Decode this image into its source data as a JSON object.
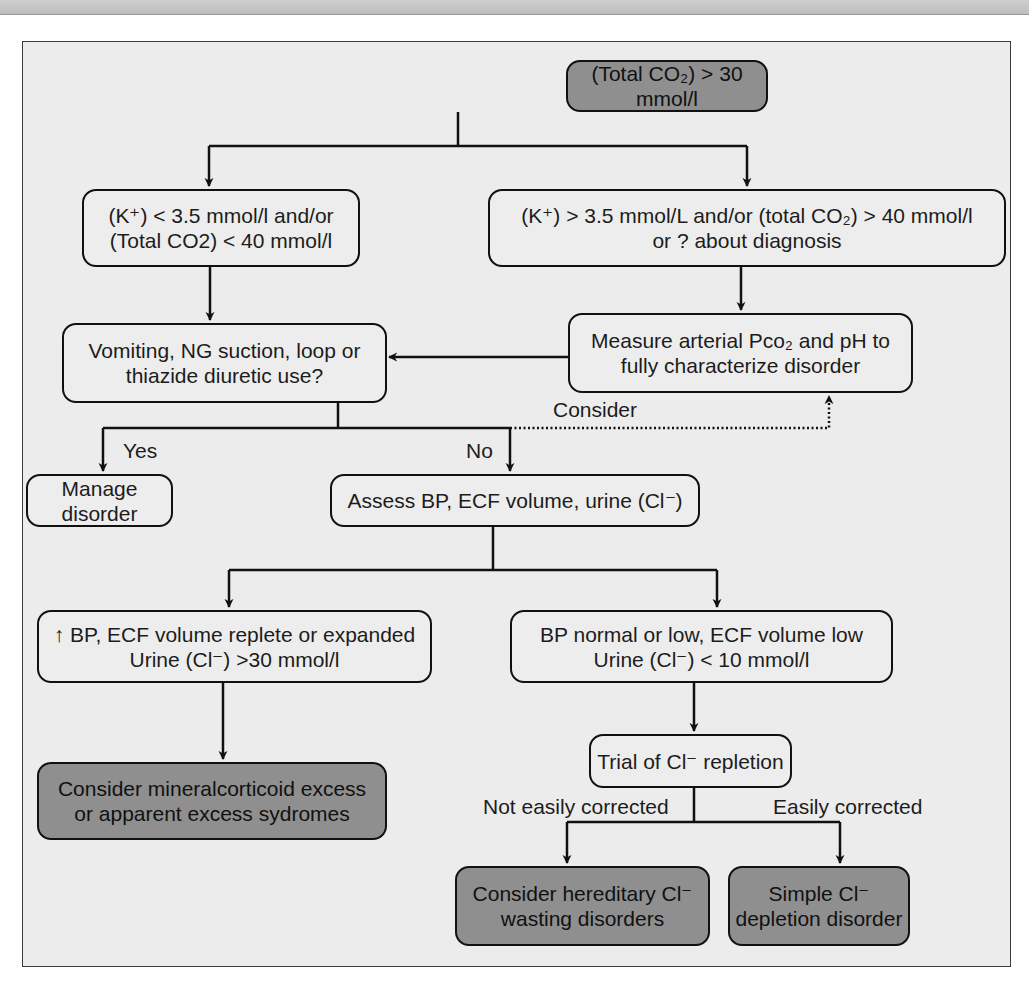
{
  "diagram": {
    "type": "flowchart",
    "colors": {
      "frame_background": "#ececec",
      "box_light": "#ededed",
      "box_dark": "#8f8f8f",
      "line": "#111111"
    },
    "nodes": {
      "start": {
        "lines": [
          "(Total CO₂) > 30 mmol/l"
        ],
        "style": "dark"
      },
      "low_k": {
        "lines": [
          "(K⁺) < 3.5 mmol/l and/or",
          "(Total CO2) < 40 mmol/l"
        ],
        "style": "light"
      },
      "high_k": {
        "lines": [
          "(K⁺) > 3.5 mmol/L and/or (total CO₂) > 40 mmol/l",
          "or ? about diagnosis"
        ],
        "style": "light"
      },
      "vomiting": {
        "lines": [
          "Vomiting, NG suction, loop or",
          "thiazide diuretic use?"
        ],
        "style": "light"
      },
      "measure": {
        "lines": [
          "Measure arterial Pco₂ and pH to",
          "fully characterize disorder"
        ],
        "style": "light"
      },
      "manage": {
        "lines": [
          "Manage disorder"
        ],
        "style": "light"
      },
      "assess": {
        "lines": [
          "Assess BP, ECF volume, urine (Cl⁻)"
        ],
        "style": "light"
      },
      "high_bp": {
        "lines": [
          "↑ BP, ECF volume replete or expanded",
          "Urine (Cl⁻) >30 mmol/l"
        ],
        "style": "light"
      },
      "low_bp": {
        "lines": [
          "BP normal or low, ECF volume low",
          "Urine (Cl⁻) < 10 mmol/l"
        ],
        "style": "light"
      },
      "mineralocorticoid": {
        "lines": [
          "Consider mineralcorticoid excess",
          "or apparent excess sydromes"
        ],
        "style": "dark"
      },
      "trial": {
        "lines": [
          "Trial of Cl⁻ repletion"
        ],
        "style": "light"
      },
      "hereditary": {
        "lines": [
          "Consider hereditary Cl⁻",
          "wasting disorders"
        ],
        "style": "dark"
      },
      "simple": {
        "lines": [
          "Simple Cl⁻",
          "depletion disorder"
        ],
        "style": "dark"
      }
    },
    "edge_labels": {
      "yes": "Yes",
      "no": "No",
      "consider": "Consider",
      "not_easily": "Not easily corrected",
      "easily": "Easily corrected"
    },
    "edges": [
      {
        "from": "start",
        "to": "low_k"
      },
      {
        "from": "start",
        "to": "high_k"
      },
      {
        "from": "low_k",
        "to": "vomiting"
      },
      {
        "from": "high_k",
        "to": "measure"
      },
      {
        "from": "measure",
        "to": "vomiting"
      },
      {
        "from": "vomiting",
        "to": "manage",
        "label": "Yes"
      },
      {
        "from": "vomiting",
        "to": "assess",
        "label": "No"
      },
      {
        "from": "vomiting",
        "to": "measure",
        "label": "Consider",
        "style": "dotted"
      },
      {
        "from": "assess",
        "to": "high_bp"
      },
      {
        "from": "assess",
        "to": "low_bp"
      },
      {
        "from": "high_bp",
        "to": "mineralocorticoid"
      },
      {
        "from": "low_bp",
        "to": "trial"
      },
      {
        "from": "trial",
        "to": "hereditary",
        "label": "Not easily corrected"
      },
      {
        "from": "trial",
        "to": "simple",
        "label": "Easily corrected"
      }
    ]
  }
}
